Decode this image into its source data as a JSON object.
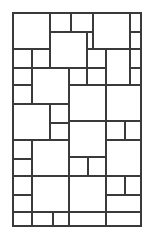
{
  "figure": {
    "name": "hopscotch-paving-pattern",
    "background_color": "#ffffff",
    "line_color": "#3a3a3a",
    "tile_fill": "#ffffff",
    "frame": {
      "x": 13,
      "y": 13,
      "width": 128,
      "height": 213,
      "stroke_width": 2.2
    },
    "tile_stroke_width": 1.1,
    "counts": {
      "large_tiles": 22,
      "small_tiles": 24,
      "total_tiles": 46
    },
    "tiles": [
      {
        "id": "t01",
        "size": "large",
        "x": 13,
        "y": 13,
        "w": 37,
        "h": 36
      },
      {
        "id": "t02",
        "size": "small",
        "x": 50,
        "y": 13,
        "w": 21,
        "h": 19
      },
      {
        "id": "t03",
        "size": "small",
        "x": 71,
        "y": 13,
        "w": 22,
        "h": 19
      },
      {
        "id": "t04",
        "size": "large",
        "x": 93,
        "y": 13,
        "w": 37,
        "h": 36
      },
      {
        "id": "t05",
        "size": "small",
        "x": 130,
        "y": 13,
        "w": 11,
        "h": 19
      },
      {
        "id": "t06",
        "size": "large",
        "x": 50,
        "y": 32,
        "w": 37,
        "h": 36
      },
      {
        "id": "t07",
        "size": "small",
        "x": 87,
        "y": 32,
        "w": 6,
        "h": 17
      },
      {
        "id": "t08",
        "size": "small",
        "x": 130,
        "y": 32,
        "w": 11,
        "h": 17
      },
      {
        "id": "t09",
        "size": "small",
        "x": 87,
        "y": 49,
        "w": 19,
        "h": 19
      },
      {
        "id": "t10",
        "size": "large",
        "x": 106,
        "y": 49,
        "w": 24,
        "h": 36
      },
      {
        "id": "t11",
        "size": "small",
        "x": 130,
        "y": 49,
        "w": 11,
        "h": 19
      },
      {
        "id": "t12",
        "size": "small",
        "x": 13,
        "y": 49,
        "w": 19,
        "h": 19
      },
      {
        "id": "t13",
        "size": "large",
        "x": 32,
        "y": 49,
        "w": 18,
        "h": 19
      },
      {
        "id": "t14",
        "size": "large",
        "x": 32,
        "y": 68,
        "w": 37,
        "h": 36
      },
      {
        "id": "t15",
        "size": "small",
        "x": 13,
        "y": 68,
        "w": 19,
        "h": 17
      },
      {
        "id": "t16",
        "size": "small",
        "x": 69,
        "y": 68,
        "w": 18,
        "h": 17
      },
      {
        "id": "t17",
        "size": "small",
        "x": 130,
        "y": 68,
        "w": 11,
        "h": 17
      },
      {
        "id": "t18",
        "size": "small",
        "x": 13,
        "y": 85,
        "w": 19,
        "h": 19
      },
      {
        "id": "t19",
        "size": "large",
        "x": 69,
        "y": 85,
        "w": 37,
        "h": 36
      },
      {
        "id": "t20",
        "size": "large",
        "x": 106,
        "y": 85,
        "w": 35,
        "h": 36
      },
      {
        "id": "t21",
        "size": "large",
        "x": 13,
        "y": 104,
        "w": 37,
        "h": 36
      },
      {
        "id": "t22",
        "size": "small",
        "x": 50,
        "y": 104,
        "w": 19,
        "h": 19
      },
      {
        "id": "t23",
        "size": "small",
        "x": 50,
        "y": 123,
        "w": 19,
        "h": 17
      },
      {
        "id": "t24",
        "size": "large",
        "x": 69,
        "y": 121,
        "w": 37,
        "h": 36
      },
      {
        "id": "t25",
        "size": "small",
        "x": 106,
        "y": 121,
        "w": 19,
        "h": 19
      },
      {
        "id": "t26",
        "size": "small",
        "x": 125,
        "y": 121,
        "w": 16,
        "h": 19
      },
      {
        "id": "t27",
        "size": "large",
        "x": 106,
        "y": 140,
        "w": 35,
        "h": 36
      },
      {
        "id": "t28",
        "size": "small",
        "x": 13,
        "y": 140,
        "w": 19,
        "h": 19
      },
      {
        "id": "t29",
        "size": "large",
        "x": 32,
        "y": 140,
        "w": 37,
        "h": 36
      },
      {
        "id": "t30",
        "size": "small",
        "x": 13,
        "y": 159,
        "w": 19,
        "h": 17
      },
      {
        "id": "t31",
        "size": "small",
        "x": 69,
        "y": 157,
        "w": 19,
        "h": 19
      },
      {
        "id": "t32",
        "size": "small",
        "x": 88,
        "y": 157,
        "w": 18,
        "h": 19
      },
      {
        "id": "t33",
        "size": "large",
        "x": 13,
        "y": 176,
        "w": 19,
        "h": 19
      },
      {
        "id": "t34",
        "size": "large",
        "x": 32,
        "y": 176,
        "w": 37,
        "h": 36
      },
      {
        "id": "t35",
        "size": "large",
        "x": 69,
        "y": 176,
        "w": 37,
        "h": 36
      },
      {
        "id": "t36",
        "size": "small",
        "x": 106,
        "y": 176,
        "w": 19,
        "h": 19
      },
      {
        "id": "t37",
        "size": "small",
        "x": 125,
        "y": 176,
        "w": 16,
        "h": 19
      },
      {
        "id": "t38",
        "size": "small",
        "x": 106,
        "y": 195,
        "w": 35,
        "h": 17
      },
      {
        "id": "t39",
        "size": "small",
        "x": 13,
        "y": 195,
        "w": 19,
        "h": 17
      },
      {
        "id": "t40",
        "size": "small",
        "x": 13,
        "y": 212,
        "w": 19,
        "h": 14
      },
      {
        "id": "t41",
        "size": "small",
        "x": 32,
        "y": 212,
        "w": 21,
        "h": 14
      },
      {
        "id": "t42",
        "size": "small",
        "x": 53,
        "y": 212,
        "w": 16,
        "h": 14
      },
      {
        "id": "t43",
        "size": "small",
        "x": 69,
        "y": 212,
        "w": 37,
        "h": 14
      },
      {
        "id": "t44",
        "size": "small",
        "x": 106,
        "y": 212,
        "w": 35,
        "h": 14
      },
      {
        "id": "t45",
        "size": "small",
        "x": 87,
        "y": 68,
        "w": 19,
        "h": 17
      },
      {
        "id": "t46",
        "size": "small",
        "x": 50,
        "y": 68,
        "w": 19,
        "h": 0
      }
    ],
    "edges": [
      {
        "id": "h-row-1",
        "orientation": "horizontal",
        "y": 32,
        "x1": 50,
        "x2": 93
      },
      {
        "id": "h-row-2",
        "orientation": "horizontal",
        "y": 49,
        "x1": 13,
        "x2": 141
      },
      {
        "id": "h-row-3",
        "orientation": "horizontal",
        "y": 68,
        "x1": 13,
        "x2": 141
      },
      {
        "id": "h-row-4",
        "orientation": "horizontal",
        "y": 85,
        "x1": 13,
        "x2": 141
      },
      {
        "id": "h-row-5",
        "orientation": "horizontal",
        "y": 104,
        "x1": 13,
        "x2": 141
      },
      {
        "id": "h-row-6",
        "orientation": "horizontal",
        "y": 121,
        "x1": 50,
        "x2": 141
      },
      {
        "id": "h-row-7",
        "orientation": "horizontal",
        "y": 140,
        "x1": 13,
        "x2": 141
      },
      {
        "id": "h-row-8",
        "orientation": "horizontal",
        "y": 157,
        "x1": 13,
        "x2": 141
      },
      {
        "id": "h-row-9",
        "orientation": "horizontal",
        "y": 176,
        "x1": 13,
        "x2": 141
      },
      {
        "id": "h-row-10",
        "orientation": "horizontal",
        "y": 195,
        "x1": 13,
        "x2": 141
      },
      {
        "id": "h-row-11",
        "orientation": "horizontal",
        "y": 212,
        "x1": 13,
        "x2": 141
      },
      {
        "id": "v-col-1",
        "orientation": "vertical",
        "x": 32,
        "y1": 49,
        "y2": 68
      },
      {
        "id": "v-col-2",
        "orientation": "vertical",
        "x": 50,
        "y1": 13,
        "y2": 32
      },
      {
        "id": "v-col-3",
        "orientation": "vertical",
        "x": 69,
        "y1": 68,
        "y2": 104
      },
      {
        "id": "v-col-4",
        "orientation": "vertical",
        "x": 87,
        "y1": 32,
        "y2": 68
      },
      {
        "id": "v-col-5",
        "orientation": "vertical",
        "x": 106,
        "y1": 49,
        "y2": 85
      },
      {
        "id": "v-col-6",
        "orientation": "vertical",
        "x": 130,
        "y1": 13,
        "y2": 85
      }
    ]
  }
}
